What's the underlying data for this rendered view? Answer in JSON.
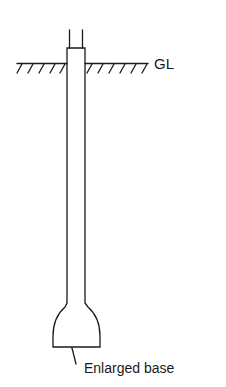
{
  "diagram": {
    "type": "enlarged-base pile elevation",
    "labels": {
      "ground_level": "GL",
      "base": "Enlarged base"
    },
    "colors": {
      "stroke": "#1a1a1a",
      "background": "#ffffff"
    }
  }
}
